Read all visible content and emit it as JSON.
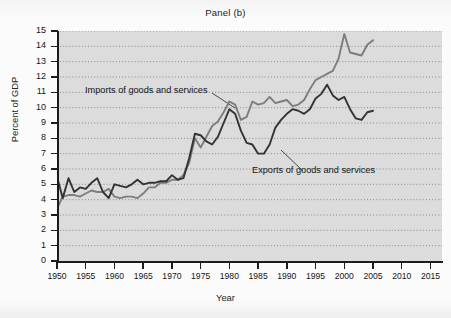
{
  "figure": {
    "panel_title": "Panel (b)"
  },
  "chart_data": {
    "type": "line",
    "title": "Panel (b)",
    "xlabel": "Year",
    "ylabel": "Percent of GDP",
    "xlim": [
      1950,
      2017
    ],
    "ylim": [
      0,
      15
    ],
    "xticks": [
      1950,
      1955,
      1960,
      1965,
      1970,
      1975,
      1980,
      1985,
      1990,
      1995,
      2000,
      2005,
      2010,
      2015
    ],
    "yticks": [
      0,
      1,
      2,
      3,
      4,
      5,
      6,
      7,
      8,
      9,
      10,
      11,
      12,
      13,
      14,
      15
    ],
    "grid": "horizontal-dotted",
    "legend": "inline-annotations",
    "annotations": [
      {
        "text": "Imports of goods and services",
        "series": "imports"
      },
      {
        "text": "Exports of goods and services",
        "series": "exports"
      }
    ],
    "colors": {
      "imports": "#7d7d7d",
      "exports": "#333333",
      "plot_bg": "#dcdcdc"
    },
    "x": [
      1950,
      1951,
      1952,
      1953,
      1954,
      1955,
      1956,
      1957,
      1958,
      1959,
      1960,
      1961,
      1962,
      1963,
      1964,
      1965,
      1966,
      1967,
      1968,
      1969,
      1970,
      1971,
      1972,
      1973,
      1974,
      1975,
      1976,
      1977,
      1978,
      1979,
      1980,
      1981,
      1982,
      1983,
      1984,
      1985,
      1986,
      1987,
      1988,
      1989,
      1990,
      1991,
      1992,
      1993,
      1994,
      1995,
      1996,
      1997,
      1998,
      1999,
      2000,
      2001,
      2002,
      2003,
      2004,
      2005
    ],
    "series": [
      {
        "name": "Exports of goods and services",
        "values": [
          5.5,
          4.1,
          5.4,
          4.5,
          4.8,
          4.7,
          5.1,
          5.4,
          4.5,
          4.1,
          5.0,
          4.9,
          4.8,
          5.0,
          5.3,
          5.0,
          5.1,
          5.1,
          5.2,
          5.2,
          5.6,
          5.3,
          5.4,
          6.7,
          8.3,
          8.2,
          7.8,
          7.6,
          8.1,
          9.0,
          9.9,
          9.6,
          8.5,
          7.7,
          7.6,
          7.0,
          7.0,
          7.6,
          8.7,
          9.2,
          9.6,
          9.9,
          9.8,
          9.6,
          9.9,
          10.6,
          10.9,
          11.5,
          10.8,
          10.5,
          10.7,
          9.9,
          9.3,
          9.2,
          9.7,
          9.8
        ]
      },
      {
        "name": "Imports of goods and services",
        "values": [
          3.4,
          4.2,
          4.3,
          4.3,
          4.2,
          4.4,
          4.6,
          4.5,
          4.5,
          4.7,
          4.2,
          4.1,
          4.2,
          4.2,
          4.1,
          4.4,
          4.8,
          4.8,
          5.1,
          5.1,
          5.3,
          5.3,
          5.6,
          6.4,
          8.0,
          7.4,
          8.1,
          8.8,
          9.1,
          9.7,
          10.4,
          10.2,
          9.2,
          9.4,
          10.4,
          10.2,
          10.3,
          10.7,
          10.3,
          10.4,
          10.5,
          10.1,
          10.2,
          10.5,
          11.2,
          11.8,
          12.0,
          12.2,
          12.4,
          13.2,
          14.8,
          13.6,
          13.5,
          13.4,
          14.1,
          14.4
        ]
      }
    ]
  },
  "axes": {
    "y_labels": [
      "15",
      "14",
      "13",
      "12",
      "11",
      "10",
      "9",
      "8",
      "7",
      "6",
      "5",
      "4",
      "3",
      "2",
      "1",
      "0"
    ],
    "x_labels": [
      "1950",
      "1955",
      "1960",
      "1965",
      "1970",
      "1975",
      "1980",
      "1985",
      "1990",
      "1995",
      "2000",
      "2005",
      "2010",
      "2015"
    ],
    "x_title": "Year",
    "y_title": "Percent of GDP"
  },
  "labels": {
    "imports": "Imports of goods and services",
    "exports": "Exports of goods and services"
  }
}
